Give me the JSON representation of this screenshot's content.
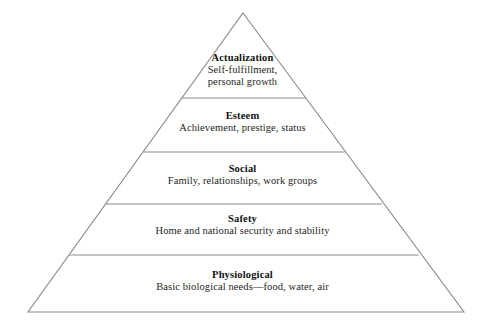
{
  "diagram": {
    "type": "pyramid",
    "name": "maslow-hierarchy-of-needs",
    "line_color": "#8a8a8a",
    "background_color": "#ffffff",
    "text_color": "#1a1a1a",
    "tiers": [
      {
        "id": "actualization",
        "level": 5,
        "title": "Actualization",
        "description_lines": [
          "Self-fulfillment,",
          "personal growth"
        ],
        "description": "Self-fulfillment, personal growth"
      },
      {
        "id": "esteem",
        "level": 4,
        "title": "Esteem",
        "description_lines": [
          "Achievement, prestige, status"
        ],
        "description": "Achievement, prestige, status"
      },
      {
        "id": "social",
        "level": 3,
        "title": "Social",
        "description_lines": [
          "Family, relationships, work groups"
        ],
        "description": "Family, relationships, work groups"
      },
      {
        "id": "safety",
        "level": 2,
        "title": "Safety",
        "description_lines": [
          "Home and national security and stability"
        ],
        "description": "Home and national security and stability"
      },
      {
        "id": "physiological",
        "level": 1,
        "title": "Physiological",
        "description_lines": [
          "Basic biological needs—food, water, air"
        ],
        "description": "Basic biological needs—food, water, air"
      }
    ]
  },
  "geometry": {
    "apex": {
      "x": 243,
      "y": 13
    },
    "base_left": {
      "x": 28,
      "y": 312
    },
    "base_right": {
      "x": 464,
      "y": 312
    },
    "divider_y": [
      98,
      152,
      204,
      255
    ]
  }
}
